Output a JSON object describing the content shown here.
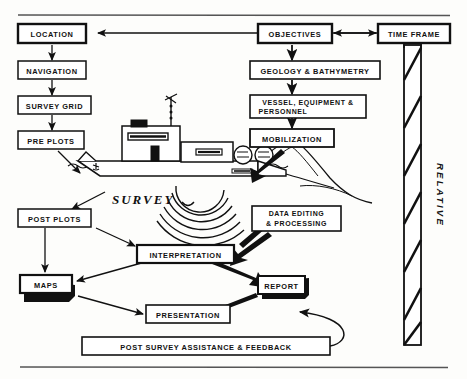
{
  "figure": {
    "title_visible": false,
    "kind": "flow-diagram"
  },
  "colors": {
    "ink": "#111111",
    "paper": "#fdfdfb",
    "rule": "#555555",
    "shadow": "#111111"
  },
  "rules": {
    "top_rule": "",
    "bottom_rule": ""
  },
  "boxes": {
    "location": "LOCATION",
    "navigation": "NAVIGATION",
    "survey_grid": "SURVEY GRID",
    "pre_plots": "PRE PLOTS",
    "post_plots": "POST PLOTS",
    "interpretation": "INTERPRETATION",
    "maps": "MAPS",
    "presentation": "PRESENTATION",
    "post_survey": "POST SURVEY ASSISTANCE & FEEDBACK",
    "objectives": "OBJECTIVES",
    "geology": "GEOLOGY & BATHYMETRY",
    "vessel_line1": "VESSEL, EQUIPMENT &",
    "vessel_line2": "PERSONNEL",
    "mobilization": "MOBILIZATION",
    "data_editing_line1": "DATA  EDITING",
    "data_editing_line2": "&  PROCESSING",
    "report": "REPORT",
    "time_frame": "TIME FRAME"
  },
  "labels": {
    "survey": "SURVEY",
    "relative": "RELATIVE"
  },
  "illustration": {
    "vessel": "survey-vessel",
    "sea": "sea-surface-waves",
    "sonar": "sonar-arcs",
    "streamer": "towed-streamer",
    "timebar": "relative-time-bar"
  }
}
